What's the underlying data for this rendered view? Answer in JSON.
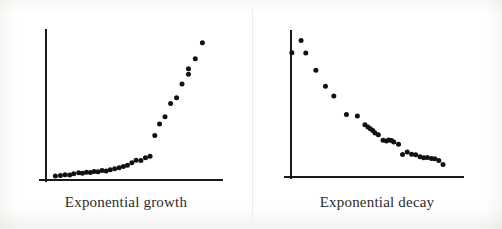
{
  "figure": {
    "background_color": "#ffffff",
    "ink_color": "#111111",
    "panel_count": 2
  },
  "panels": [
    {
      "id": "growth",
      "caption": "Exponential growth",
      "axes": {
        "x_axis_label": "",
        "y_axis_label": "",
        "x_tick_labels": [],
        "y_tick_labels": [],
        "grid": false,
        "origin": {
          "x": 46,
          "y": 181
        },
        "x_axis_end": {
          "x": 222,
          "y": 181
        },
        "y_axis_top": {
          "x": 46,
          "y": 30
        }
      }
    },
    {
      "id": "decay",
      "caption": "Exponential decay",
      "axes": {
        "x_axis_label": "",
        "y_axis_label": "",
        "x_tick_labels": [],
        "y_tick_labels": [],
        "grid": false,
        "origin": {
          "x": 39,
          "y": 178
        },
        "x_axis_end": {
          "x": 211,
          "y": 178
        },
        "y_axis_top": {
          "x": 39,
          "y": 31
        }
      }
    }
  ],
  "chart_data": [
    {
      "type": "scatter",
      "id": "exponential-growth",
      "title": "Exponential growth",
      "xlabel": "",
      "ylabel": "",
      "xlim": [
        0,
        1
      ],
      "ylim": [
        0,
        1
      ],
      "grid": false,
      "legend": null,
      "marker": "filled-circle",
      "marker_color": "#111111",
      "series": [
        {
          "name": "growth",
          "x": [
            0.055,
            0.085,
            0.112,
            0.139,
            0.163,
            0.192,
            0.214,
            0.238,
            0.261,
            0.283,
            0.306,
            0.33,
            0.354,
            0.378,
            0.404,
            0.43,
            0.455,
            0.479,
            0.505,
            0.53,
            0.558,
            0.585,
            0.612,
            0.64,
            0.668,
            0.7,
            0.733,
            0.768,
            0.8,
            0.838,
            0.838,
            0.878,
            0.92
          ],
          "y": [
            0.02,
            0.024,
            0.03,
            0.028,
            0.036,
            0.043,
            0.04,
            0.047,
            0.044,
            0.052,
            0.05,
            0.058,
            0.056,
            0.063,
            0.07,
            0.078,
            0.086,
            0.094,
            0.112,
            0.13,
            0.128,
            0.147,
            0.157,
            0.3,
            0.38,
            0.43,
            0.52,
            0.56,
            0.655,
            0.722,
            0.76,
            0.83,
            0.94
          ]
        }
      ]
    },
    {
      "type": "scatter",
      "id": "exponential-decay",
      "title": "Exponential decay",
      "xlabel": "",
      "ylabel": "",
      "xlim": [
        0,
        1
      ],
      "ylim": [
        0,
        1
      ],
      "grid": false,
      "legend": null,
      "marker": "filled-circle",
      "marker_color": "#111111",
      "series": [
        {
          "name": "decay",
          "x": [
            0.06,
            0.005,
            0.088,
            0.148,
            0.205,
            0.255,
            0.33,
            0.395,
            0.44,
            0.458,
            0.472,
            0.487,
            0.5,
            0.52,
            0.548,
            0.568,
            0.582,
            0.598,
            0.612,
            0.64,
            0.664,
            0.692,
            0.718,
            0.742,
            0.768,
            0.79,
            0.812,
            0.836,
            0.856,
            0.88,
            0.905
          ],
          "y": [
            0.948,
            0.862,
            0.86,
            0.74,
            0.628,
            0.56,
            0.43,
            0.42,
            0.358,
            0.342,
            0.33,
            0.318,
            0.3,
            0.288,
            0.25,
            0.245,
            0.252,
            0.248,
            0.238,
            0.222,
            0.15,
            0.168,
            0.152,
            0.148,
            0.135,
            0.128,
            0.13,
            0.122,
            0.12,
            0.108,
            0.08
          ]
        }
      ]
    }
  ]
}
